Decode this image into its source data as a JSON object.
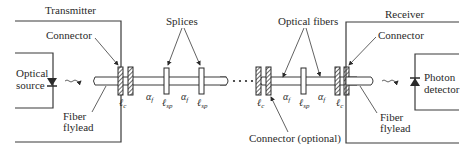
{
  "diagram": {
    "transmitter": {
      "title": "Transmitter",
      "connector_label": "Connector",
      "source_label_line1": "Optical",
      "source_label_line2": "source",
      "flylead_label_line1": "Fiber",
      "flylead_label_line2": "flylead"
    },
    "link": {
      "splices_label": "Splices",
      "optical_fibers_label": "Optical fibers",
      "optional_connector_label": "Connector (optional)",
      "alpha_symbol": "α",
      "alpha_subscript": "f",
      "ell_symbol": "ℓ",
      "connector_loss_subscript": "c",
      "splice_loss_subscript": "sp",
      "continuation": "···"
    },
    "receiver": {
      "title": "Receiver",
      "connector_label": "Connector",
      "detector_label_line1": "Photon",
      "detector_label_line2": "detector",
      "flylead_label_line1": "Fiber",
      "flylead_label_line2": "flylead"
    },
    "colors": {
      "line": "#3a3a3a",
      "text": "#2a2a2a",
      "background": "#ffffff"
    }
  }
}
